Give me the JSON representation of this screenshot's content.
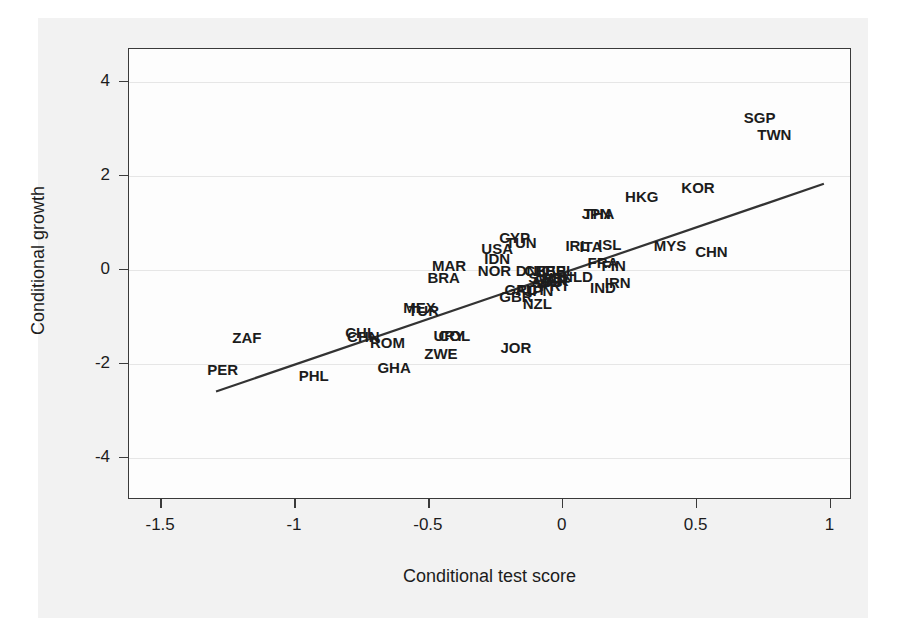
{
  "chart_data": {
    "type": "scatter",
    "title": "",
    "subtitle": "",
    "xlabel": "Conditional test score",
    "ylabel": "Conditional growth",
    "xlim": [
      -1.62,
      1.08
    ],
    "ylim": [
      -4.9,
      4.7
    ],
    "xticks": [
      -1.5,
      -1,
      -0.5,
      0,
      0.5,
      1
    ],
    "xticklabels": [
      "-1.5",
      "-1",
      "-0.5",
      "0",
      "0.5",
      "1"
    ],
    "yticks": [
      -4,
      -2,
      0,
      2,
      4
    ],
    "yticklabels": [
      "-4",
      "-2",
      "0",
      "2",
      "4"
    ],
    "grid": "horizontal",
    "legend": "none",
    "marker_style": "text-label",
    "fit_line": {
      "label": "linear fit",
      "x0": -1.295,
      "y0": -2.59,
      "x1": 0.975,
      "y1": 1.83,
      "slope": 1.95,
      "intercept": -0.062
    },
    "points": [
      {
        "label": "ZAF",
        "x": -1.18,
        "y": -1.43
      },
      {
        "label": "PER",
        "x": -1.27,
        "y": -2.12
      },
      {
        "label": "PHL",
        "x": -0.93,
        "y": -2.23
      },
      {
        "label": "GHA",
        "x": -0.63,
        "y": -2.06
      },
      {
        "label": "ROM",
        "x": -0.655,
        "y": -1.54
      },
      {
        "label": "CHL",
        "x": -0.755,
        "y": -1.32
      },
      {
        "label": "CHN",
        "x": -0.745,
        "y": -1.4
      },
      {
        "label": "ZWE",
        "x": -0.455,
        "y": -1.78
      },
      {
        "label": "URY",
        "x": -0.425,
        "y": -1.39
      },
      {
        "label": "COL",
        "x": -0.405,
        "y": -1.39
      },
      {
        "label": "JOR",
        "x": -0.175,
        "y": -1.65
      },
      {
        "label": "MEX",
        "x": -0.535,
        "y": -0.79
      },
      {
        "label": "TUR",
        "x": -0.52,
        "y": -0.86
      },
      {
        "label": "MAR",
        "x": -0.425,
        "y": 0.1
      },
      {
        "label": "BRA",
        "x": -0.445,
        "y": -0.16
      },
      {
        "label": "NOR",
        "x": -0.255,
        "y": -0.01
      },
      {
        "label": "IDN",
        "x": -0.245,
        "y": 0.25
      },
      {
        "label": "USA",
        "x": -0.245,
        "y": 0.47
      },
      {
        "label": "CYP",
        "x": -0.18,
        "y": 0.69
      },
      {
        "label": "TUN",
        "x": -0.155,
        "y": 0.59
      },
      {
        "label": "GBR",
        "x": -0.175,
        "y": -0.56
      },
      {
        "label": "GRC",
        "x": -0.155,
        "y": -0.4
      },
      {
        "label": "AUT",
        "x": -0.12,
        "y": -0.4
      },
      {
        "label": "JPN",
        "x": -0.09,
        "y": -0.43
      },
      {
        "label": "NZL",
        "x": -0.095,
        "y": -0.7
      },
      {
        "label": "DNK",
        "x": -0.115,
        "y": 0.0
      },
      {
        "label": "CHE",
        "x": -0.085,
        "y": 0.0
      },
      {
        "label": "ESP",
        "x": -0.045,
        "y": 0.0
      },
      {
        "label": "BEL",
        "x": -0.01,
        "y": 0.0
      },
      {
        "label": "SWE",
        "x": -0.065,
        "y": -0.16
      },
      {
        "label": "CAN",
        "x": -0.045,
        "y": -0.19
      },
      {
        "label": "PRT",
        "x": -0.03,
        "y": -0.32
      },
      {
        "label": "AUS",
        "x": -0.06,
        "y": -0.24
      },
      {
        "label": "ISR",
        "x": -0.025,
        "y": -0.21
      },
      {
        "label": "NLD",
        "x": 0.055,
        "y": -0.14
      },
      {
        "label": "IRL",
        "x": 0.055,
        "y": 0.52
      },
      {
        "label": "ITA",
        "x": 0.105,
        "y": 0.51
      },
      {
        "label": "ISL",
        "x": 0.175,
        "y": 0.54
      },
      {
        "label": "FRA",
        "x": 0.15,
        "y": 0.17
      },
      {
        "label": "FIN",
        "x": 0.19,
        "y": 0.1
      },
      {
        "label": "IND",
        "x": 0.15,
        "y": -0.36
      },
      {
        "label": "IRN",
        "x": 0.205,
        "y": -0.27
      },
      {
        "label": "JPN2",
        "x": 0.125,
        "y": 1.2
      },
      {
        "label": "THA",
        "x": 0.135,
        "y": 1.2
      },
      {
        "label": "HKG",
        "x": 0.295,
        "y": 1.58
      },
      {
        "label": "KOR",
        "x": 0.505,
        "y": 1.76
      },
      {
        "label": "MYS",
        "x": 0.4,
        "y": 0.52
      },
      {
        "label": "CHN2",
        "x": 0.555,
        "y": 0.41
      },
      {
        "label": "SGP",
        "x": 0.735,
        "y": 3.25
      },
      {
        "label": "TWN",
        "x": 0.79,
        "y": 2.9
      }
    ]
  },
  "axis": {
    "x_title": "Conditional test score",
    "y_title": "Conditional growth"
  }
}
